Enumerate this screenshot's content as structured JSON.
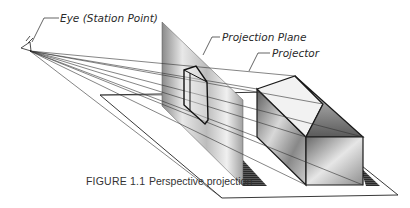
{
  "figure": {
    "labels": {
      "eye": "Eye (Station Point)",
      "projection_plane": "Projection Plane",
      "projector": "Projector"
    },
    "caption": {
      "number": "FIGURE 1.1",
      "text": "Perspective projection"
    }
  }
}
